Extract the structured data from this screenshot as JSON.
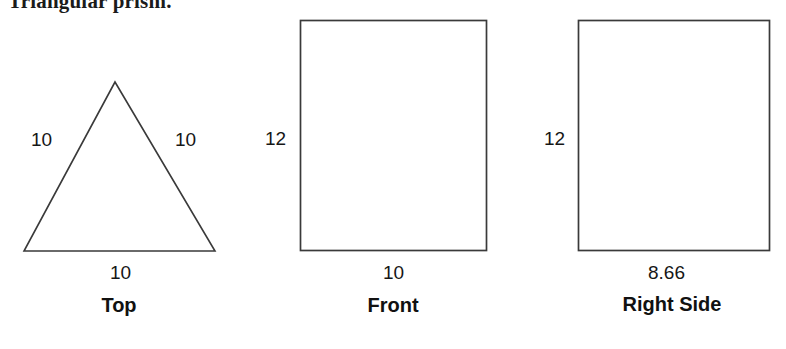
{
  "heading": {
    "text": "Triangular prism."
  },
  "figure": {
    "type": "orthographic-projection",
    "stroke_color": "#3a3a3a",
    "background_color": "#ffffff",
    "views": [
      {
        "id": "top",
        "caption": "Top",
        "shape": "equilateral-triangle",
        "labels": {
          "left_side": "10",
          "right_side": "10",
          "base": "10"
        }
      },
      {
        "id": "front",
        "caption": "Front",
        "shape": "rectangle",
        "labels": {
          "height": "12",
          "width": "10"
        }
      },
      {
        "id": "right-side",
        "caption": "Right Side",
        "shape": "rectangle",
        "labels": {
          "height": "12",
          "width": "8.66"
        }
      }
    ]
  }
}
